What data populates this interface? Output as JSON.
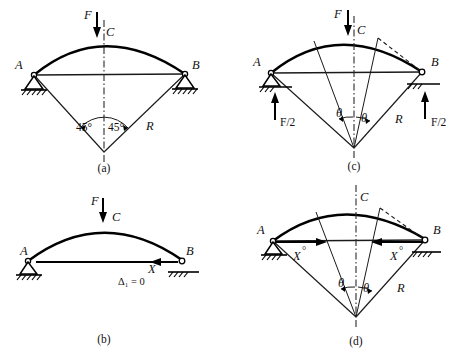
{
  "figure": {
    "panels": [
      {
        "id": "a",
        "caption": "(a)",
        "labels": {
          "force": "F",
          "crown": "C",
          "left_support": "A",
          "right_support": "B",
          "angle_left": "45°",
          "angle_right": "45°",
          "radius": "R"
        }
      },
      {
        "id": "b",
        "caption": "(b)",
        "labels": {
          "force": "F",
          "crown": "C",
          "left_support": "A",
          "right_support": "B",
          "redundant": "X",
          "compat": "Δ₁ = 0"
        }
      },
      {
        "id": "c",
        "caption": "(c)",
        "labels": {
          "force": "F",
          "crown": "C",
          "left_support": "A",
          "right_support": "B",
          "reaction_left": "F/2",
          "reaction_right": "F/2",
          "angle_left": "θ",
          "angle_right": "θ",
          "radius": "R"
        }
      },
      {
        "id": "d",
        "caption": "(d)",
        "labels": {
          "crown": "C",
          "left_support": "A",
          "right_support": "B",
          "redundant_left": "X",
          "redundant_left_sup": "°",
          "redundant_right": "X",
          "redundant_right_sup": "°",
          "angle_left": "θ",
          "angle_right": "θ",
          "radius": "R"
        }
      }
    ],
    "colors": {
      "ink": "#000000",
      "line": "#1a1a1a",
      "background": "#ffffff"
    }
  }
}
